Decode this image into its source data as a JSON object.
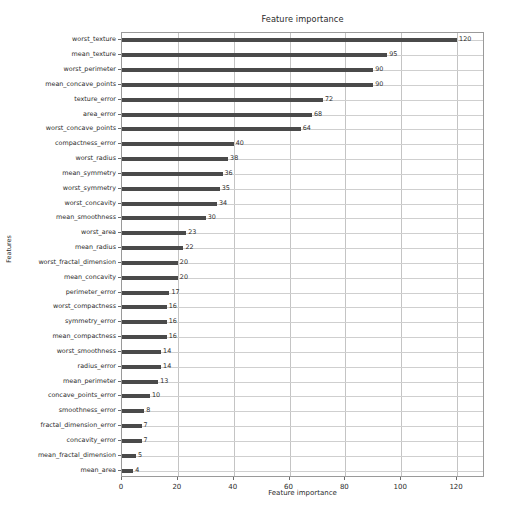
{
  "chart_data": {
    "type": "bar",
    "orientation": "horizontal",
    "title": "Feature importance",
    "xlabel": "Feature importance",
    "ylabel": "Features",
    "xlim": [
      0,
      130
    ],
    "ylim_categories_top_to_bottom": true,
    "grid": true,
    "legend": null,
    "bar_color": "#4a4a4a",
    "xticks": [
      0,
      20,
      40,
      60,
      80,
      100,
      120
    ],
    "categories": [
      "worst_texture",
      "mean_texture",
      "worst_perimeter",
      "mean_concave_points",
      "texture_error",
      "area_error",
      "worst_concave_points",
      "compactness_error",
      "worst_radius",
      "mean_symmetry",
      "worst_symmetry",
      "worst_concavity",
      "mean_smoothness",
      "worst_area",
      "mean_radius",
      "worst_fractal_dimension",
      "mean_concavity",
      "perimeter_error",
      "worst_compactness",
      "symmetry_error",
      "mean_compactness",
      "worst_smoothness",
      "radius_error",
      "mean_perimeter",
      "concave_points_error",
      "smoothness_error",
      "fractal_dimension_error",
      "concavity_error",
      "mean_fractal_dimension",
      "mean_area"
    ],
    "values": [
      120,
      95,
      90,
      90,
      72,
      68,
      64,
      40,
      38,
      36,
      35,
      34,
      30,
      23,
      22,
      20,
      20,
      17,
      16,
      16,
      16,
      14,
      14,
      13,
      10,
      8,
      7,
      7,
      5,
      4
    ],
    "value_labels": [
      "120",
      "95",
      "90",
      "90",
      "72",
      "68",
      "64",
      "40",
      "38",
      "36",
      "35",
      "34",
      "30",
      "23",
      "22",
      "20",
      "20",
      "17",
      "16",
      "16",
      "16",
      "14",
      "14",
      "13",
      "10",
      "8",
      "7",
      "7",
      "5",
      "4"
    ]
  }
}
